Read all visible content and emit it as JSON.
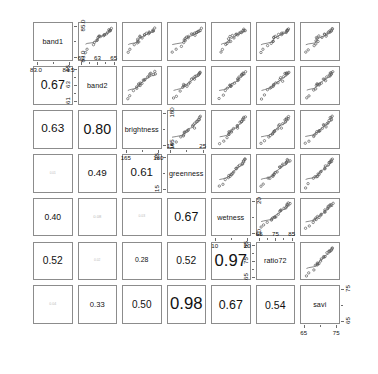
{
  "chart_data": {
    "type": "scatter",
    "title": "",
    "subtitle": "",
    "xlabel": "",
    "ylabel": "",
    "grid": false,
    "legend": "none",
    "matrix_kind": "scatterplot-matrix",
    "variables": [
      "band1",
      "band2",
      "brightness",
      "greenness",
      "wetness",
      "ratio72",
      "savi"
    ],
    "diagonal_labels": [
      "band1",
      "band2",
      "brightness",
      "greenness",
      "wetness",
      "ratio72",
      "savi"
    ],
    "upper_panel": "scatter with loess smooth",
    "lower_panel": "absolute correlation, text size scaled by magnitude",
    "correlations": [
      {
        "row": "band2",
        "col": "band1",
        "value": "0.67",
        "magnitude": 0.67
      },
      {
        "row": "brightness",
        "col": "band1",
        "value": "0.63",
        "magnitude": 0.63
      },
      {
        "row": "brightness",
        "col": "band2",
        "value": "0.80",
        "magnitude": 0.8
      },
      {
        "row": "greenness",
        "col": "band1",
        "value": "0.01",
        "magnitude": 0.01
      },
      {
        "row": "greenness",
        "col": "band2",
        "value": "0.49",
        "magnitude": 0.49
      },
      {
        "row": "greenness",
        "col": "brightness",
        "value": "0.61",
        "magnitude": 0.61
      },
      {
        "row": "wetness",
        "col": "band1",
        "value": "0.40",
        "magnitude": 0.4
      },
      {
        "row": "wetness",
        "col": "band2",
        "value": "0.08",
        "magnitude": 0.08
      },
      {
        "row": "wetness",
        "col": "brightness",
        "value": "0.03",
        "magnitude": 0.03
      },
      {
        "row": "wetness",
        "col": "greenness",
        "value": "0.67",
        "magnitude": 0.67
      },
      {
        "row": "ratio72",
        "col": "band1",
        "value": "0.52",
        "magnitude": 0.52
      },
      {
        "row": "ratio72",
        "col": "band2",
        "value": "0.02",
        "magnitude": 0.02
      },
      {
        "row": "ratio72",
        "col": "brightness",
        "value": "0.28",
        "magnitude": 0.28
      },
      {
        "row": "ratio72",
        "col": "greenness",
        "value": "0.52",
        "magnitude": 0.52
      },
      {
        "row": "ratio72",
        "col": "wetness",
        "value": "0.97",
        "magnitude": 0.97
      },
      {
        "row": "savi",
        "col": "band1",
        "value": "0.04",
        "magnitude": 0.04
      },
      {
        "row": "savi",
        "col": "band2",
        "value": "0.33",
        "magnitude": 0.33
      },
      {
        "row": "savi",
        "col": "brightness",
        "value": "0.50",
        "magnitude": 0.5
      },
      {
        "row": "savi",
        "col": "greenness",
        "value": "0.98",
        "magnitude": 0.98
      },
      {
        "row": "savi",
        "col": "wetness",
        "value": "0.67",
        "magnitude": 0.67
      },
      {
        "row": "savi",
        "col": "ratio72",
        "value": "0.54",
        "magnitude": 0.54
      }
    ],
    "axes": [
      {
        "variable": "band1",
        "index": 0,
        "side": "bottom",
        "ticks": [
          "83.0",
          "84.5"
        ],
        "range": [
          82.6,
          85.3
        ]
      },
      {
        "variable": "band1",
        "index": 0,
        "side": "right",
        "ticks": [
          "85.0",
          "83.0"
        ],
        "range": [
          82.6,
          85.3
        ]
      },
      {
        "variable": "band2",
        "index": 1,
        "side": "top",
        "ticks": [
          "61",
          "63",
          "65"
        ],
        "range": [
          60.2,
          66.0
        ]
      },
      {
        "variable": "band2",
        "index": 1,
        "side": "left",
        "ticks": [
          "65",
          "63",
          "61"
        ],
        "range": [
          60.2,
          66.0
        ]
      },
      {
        "variable": "brightness",
        "index": 2,
        "side": "bottom",
        "ticks": [
          "165",
          "180"
        ],
        "range": [
          160,
          188
        ]
      },
      {
        "variable": "brightness",
        "index": 2,
        "side": "right",
        "ticks": [
          "180",
          "165"
        ],
        "range": [
          160,
          188
        ]
      },
      {
        "variable": "greenness",
        "index": 3,
        "side": "top",
        "ticks": [
          "15",
          "25"
        ],
        "range": [
          11,
          30
        ]
      },
      {
        "variable": "greenness",
        "index": 3,
        "side": "left",
        "ticks": [
          "25",
          "15"
        ],
        "range": [
          11,
          30
        ]
      },
      {
        "variable": "wetness",
        "index": 4,
        "side": "bottom",
        "ticks": [
          "10",
          "20"
        ],
        "range": [
          6,
          26
        ]
      },
      {
        "variable": "wetness",
        "index": 4,
        "side": "right",
        "ticks": [
          "20",
          "10"
        ],
        "range": [
          6,
          26
        ]
      },
      {
        "variable": "ratio72",
        "index": 5,
        "side": "top",
        "ticks": [
          "65",
          "75",
          "85"
        ],
        "range": [
          61,
          90
        ]
      },
      {
        "variable": "ratio72",
        "index": 5,
        "side": "left",
        "ticks": [
          "85",
          "75",
          "65"
        ],
        "range": [
          61,
          90
        ]
      },
      {
        "variable": "savi",
        "index": 6,
        "side": "bottom",
        "ticks": [
          "65",
          "75"
        ],
        "range": [
          61,
          81
        ]
      },
      {
        "variable": "savi",
        "index": 6,
        "side": "right",
        "ticks": [
          "75",
          "65"
        ],
        "range": [
          61,
          81
        ]
      }
    ],
    "points": {
      "band1": [
        84.0,
        83.2,
        84.6,
        84.8,
        84.3,
        83.6,
        84.9,
        85.0,
        84.5,
        84.7,
        84.4,
        83.0,
        84.8,
        84.9,
        84.2,
        83.8,
        84.6,
        85.1,
        84.3,
        84.0
      ],
      "band2": [
        63.0,
        61.1,
        64.4,
        65.2,
        63.6,
        62.2,
        65.4,
        65.6,
        64.1,
        64.8,
        63.4,
        60.6,
        65.1,
        65.3,
        63.2,
        62.6,
        64.2,
        65.5,
        63.1,
        62.9
      ],
      "brightness": [
        172,
        163,
        178,
        182,
        174,
        167,
        183,
        185,
        176,
        180,
        173,
        161,
        181,
        184,
        171,
        169,
        177,
        186,
        172,
        170
      ],
      "greenness": [
        20,
        14,
        24,
        27,
        22,
        17,
        28,
        29,
        25,
        26,
        21,
        12,
        27,
        28,
        19,
        18,
        24,
        29,
        20,
        19
      ],
      "wetness": [
        16,
        11,
        20,
        23,
        18,
        13,
        24,
        25,
        21,
        22,
        17,
        9,
        23,
        24,
        15,
        14,
        20,
        25,
        16,
        15
      ],
      "ratio72": [
        74,
        64,
        80,
        85,
        77,
        68,
        86,
        87,
        81,
        83,
        75,
        62,
        85,
        86,
        73,
        71,
        79,
        88,
        74,
        72
      ],
      "savi": [
        70,
        64,
        74,
        77,
        72,
        67,
        78,
        79,
        75,
        76,
        71,
        62,
        77,
        78,
        69,
        68,
        74,
        79,
        70,
        69
      ]
    }
  }
}
